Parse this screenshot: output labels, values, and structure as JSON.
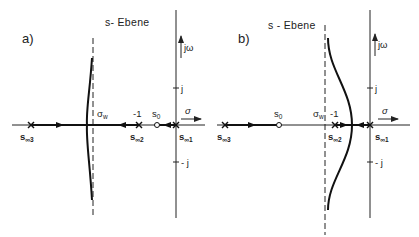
{
  "panels": [
    {
      "id": "a",
      "label": "a)",
      "title": "s- Ebene",
      "axis_imag_label": "jω",
      "axis_real_label": "σ",
      "tick_pos_j": "j",
      "tick_neg_j": "- j",
      "asymptote_label": "σ",
      "asymptote_sub": "w",
      "minus_one": "-1",
      "s0": "s",
      "s0_sub": "0",
      "s_inf1": "s",
      "s_inf1_sub": "∞1",
      "s_inf2": "s",
      "s_inf2_sub": "∞2",
      "s_inf3": "s",
      "s_inf3_sub": "∞3"
    },
    {
      "id": "b",
      "label": "b)",
      "title": "s - Ebene",
      "axis_imag_label": "jω",
      "axis_real_label": "σ",
      "tick_pos_j": "j",
      "tick_neg_j": "- j",
      "asymptote_label": "σ",
      "asymptote_sub": "w",
      "minus_one": "-1",
      "s0": "s",
      "s0_sub": "0",
      "s_inf1": "s",
      "s_inf1_sub": "∞1",
      "s_inf2": "s",
      "s_inf2_sub": "∞2",
      "s_inf3": "s",
      "s_inf3_sub": "∞3"
    }
  ],
  "colors": {
    "ink": "#222222",
    "background": "#ffffff"
  }
}
